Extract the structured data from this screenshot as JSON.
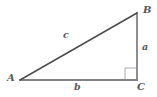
{
  "figure": {
    "name": "right-triangle-labeled",
    "background_color": "#ffffff",
    "line_color_hypotenuse": "#4d4d4f",
    "line_color_legs": "#808285",
    "right_angle_color": "#a7a9ac",
    "label_color": "#58585a",
    "vertices": {
      "A": {
        "label": "A",
        "x": 20,
        "y": 80
      },
      "B": {
        "label": "B",
        "x": 137,
        "y": 13
      },
      "C": {
        "label": "C",
        "x": 137,
        "y": 80
      }
    },
    "sides": {
      "a": {
        "label": "a",
        "from": "B",
        "to": "C",
        "orientation": "vertical"
      },
      "b": {
        "label": "b",
        "from": "A",
        "to": "C",
        "orientation": "horizontal"
      },
      "c": {
        "label": "c",
        "from": "A",
        "to": "B",
        "orientation": "hypotenuse"
      }
    },
    "right_angle": {
      "at_vertex": "C",
      "marker": "square",
      "size": 12
    }
  }
}
